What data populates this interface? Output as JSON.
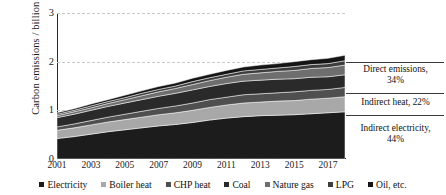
{
  "chart_data": {
    "type": "area",
    "title": "",
    "xlabel": "",
    "ylabel": "Carbon emissions / billion CO",
    "ylabel_sub": "2",
    "ylim": [
      0,
      3
    ],
    "yticks": [
      0,
      1,
      2,
      3
    ],
    "ytick_labels": [
      "0",
      "1",
      "2",
      "3"
    ],
    "grid": "horizontal-dashed",
    "xlim": [
      2001,
      2018
    ],
    "xticks": [
      2001,
      2003,
      2005,
      2007,
      2009,
      2011,
      2013,
      2015,
      2017
    ],
    "xtick_labels": [
      "2001",
      "2003",
      "2005",
      "2007",
      "2009",
      "2011",
      "2013",
      "2015",
      "2017"
    ],
    "x": [
      2001,
      2002,
      2003,
      2004,
      2005,
      2006,
      2007,
      2008,
      2009,
      2010,
      2011,
      2012,
      2013,
      2014,
      2015,
      2016,
      2017,
      2018
    ],
    "stacked": true,
    "legend_position": "bottom",
    "series": [
      {
        "name": "Electricity",
        "color": "#1c1c1c",
        "values": [
          0.42,
          0.46,
          0.51,
          0.56,
          0.6,
          0.64,
          0.68,
          0.71,
          0.75,
          0.8,
          0.84,
          0.87,
          0.89,
          0.9,
          0.91,
          0.93,
          0.95,
          0.97
        ]
      },
      {
        "name": "Boiler heat",
        "color": "#a8a8a8",
        "values": [
          0.17,
          0.18,
          0.19,
          0.2,
          0.21,
          0.22,
          0.23,
          0.24,
          0.25,
          0.26,
          0.27,
          0.28,
          0.28,
          0.29,
          0.29,
          0.3,
          0.3,
          0.31
        ]
      },
      {
        "name": "CHP heat",
        "color": "#4f4f4f",
        "values": [
          0.07,
          0.08,
          0.09,
          0.1,
          0.11,
          0.12,
          0.13,
          0.14,
          0.15,
          0.16,
          0.16,
          0.17,
          0.17,
          0.17,
          0.18,
          0.18,
          0.18,
          0.19
        ]
      },
      {
        "name": "Coal",
        "color": "#2a2a2a",
        "values": [
          0.19,
          0.2,
          0.21,
          0.22,
          0.23,
          0.24,
          0.25,
          0.26,
          0.27,
          0.27,
          0.28,
          0.28,
          0.28,
          0.28,
          0.27,
          0.27,
          0.26,
          0.26
        ]
      },
      {
        "name": "Nature gas",
        "color": "#6e6e6e",
        "values": [
          0.04,
          0.05,
          0.05,
          0.06,
          0.07,
          0.08,
          0.09,
          0.1,
          0.11,
          0.12,
          0.13,
          0.14,
          0.15,
          0.16,
          0.17,
          0.18,
          0.19,
          0.2
        ]
      },
      {
        "name": "LPG",
        "color": "#3d3d3d",
        "values": [
          0.03,
          0.03,
          0.04,
          0.04,
          0.04,
          0.05,
          0.05,
          0.05,
          0.06,
          0.06,
          0.06,
          0.07,
          0.07,
          0.07,
          0.08,
          0.08,
          0.08,
          0.09
        ]
      },
      {
        "name": "Oil, etc.",
        "color": "#151515",
        "values": [
          0.03,
          0.03,
          0.04,
          0.04,
          0.05,
          0.05,
          0.06,
          0.06,
          0.07,
          0.07,
          0.08,
          0.08,
          0.09,
          0.09,
          0.1,
          0.1,
          0.11,
          0.11
        ]
      }
    ],
    "annotations": [
      {
        "id": "direct-emissions",
        "text_line1": "Direct emissions,",
        "text_line2": "34%"
      },
      {
        "id": "indirect-heat",
        "text_line1": "Indirect heat, 22%",
        "text_line2": ""
      },
      {
        "id": "indirect-electricity",
        "text_line1": "Indirect electricity,",
        "text_line2": "44%"
      }
    ]
  }
}
